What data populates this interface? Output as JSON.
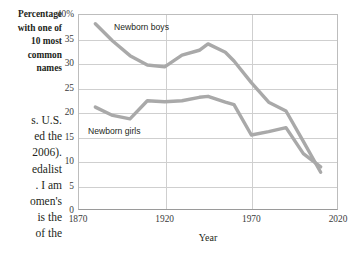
{
  "page": {
    "body_text_lines": [
      "s. U.S.",
      "ed the",
      "2006).",
      "edalist",
      ". I am",
      "omen's",
      "is the",
      "of the"
    ],
    "y_caption_lines": [
      "Percentage",
      "with one of",
      "10 most",
      "common",
      "names"
    ]
  },
  "chart_data": {
    "type": "line",
    "title": "",
    "xlabel": "Year",
    "ylabel": "Percentage with one of 10 most common names",
    "xlim": [
      1870,
      2020
    ],
    "ylim": [
      0,
      40
    ],
    "xticks": [
      "1870",
      "1920",
      "1970",
      "2020"
    ],
    "xtick_values": [
      1870,
      1920,
      1970,
      2020
    ],
    "yticks": [
      "0",
      "5",
      "10",
      "15",
      "20",
      "25",
      "30",
      "35",
      "40%"
    ],
    "ytick_values": [
      0,
      5,
      10,
      15,
      20,
      25,
      30,
      35,
      40
    ],
    "grid": true,
    "legend": "inline-labels",
    "line_color": "#a9a9a9",
    "series": [
      {
        "name": "Newborn boys",
        "label_position": "above-left",
        "x": [
          1880,
          1890,
          1900,
          1910,
          1920,
          1930,
          1940,
          1945,
          1955,
          1960,
          1970,
          1980,
          1990,
          2000,
          2010
        ],
        "values": [
          38.0,
          34.5,
          31.5,
          29.6,
          29.2,
          31.6,
          32.6,
          33.9,
          32.2,
          30.4,
          26.0,
          22.0,
          20.2,
          14.0,
          7.7
        ]
      },
      {
        "name": "Newborn girls",
        "label_position": "below-left",
        "x": [
          1880,
          1890,
          1900,
          1910,
          1920,
          1930,
          1940,
          1945,
          1955,
          1960,
          1970,
          1980,
          1990,
          2000,
          2010
        ],
        "values": [
          21.0,
          19.3,
          18.6,
          22.3,
          22.1,
          22.3,
          23.0,
          23.2,
          22.0,
          21.5,
          15.3,
          16.0,
          16.8,
          11.5,
          8.8
        ]
      }
    ]
  }
}
